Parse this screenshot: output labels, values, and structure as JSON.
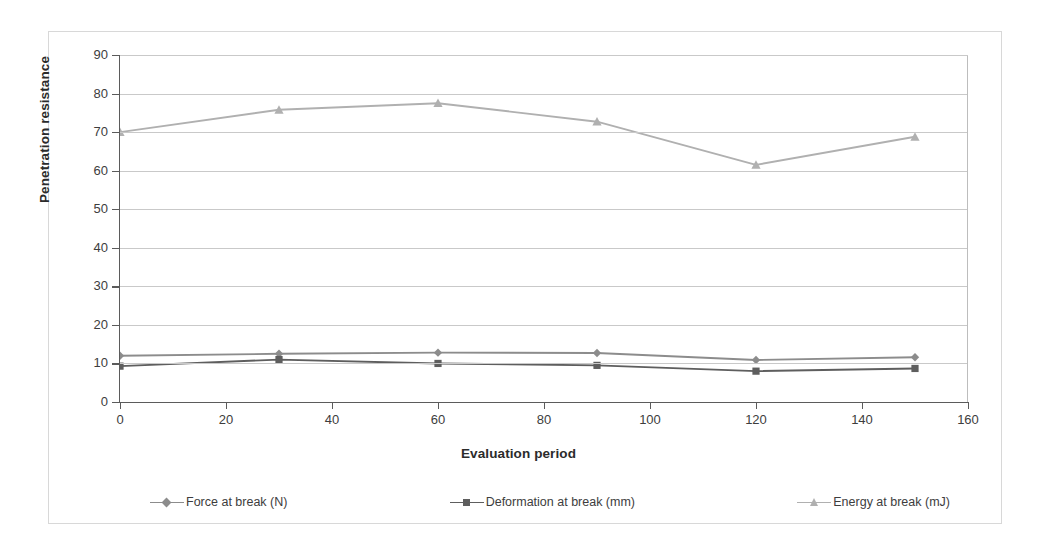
{
  "chart_data": {
    "type": "line",
    "title": "",
    "xlabel": "Evaluation period",
    "ylabel": "Penetration resistance",
    "xlim": [
      0,
      160
    ],
    "ylim": [
      0,
      90
    ],
    "xticks": [
      0,
      20,
      40,
      60,
      80,
      100,
      120,
      140,
      160
    ],
    "yticks": [
      0,
      10,
      20,
      30,
      40,
      50,
      60,
      70,
      80,
      90
    ],
    "grid": "horizontal",
    "legend_position": "bottom",
    "x": [
      0,
      30,
      60,
      90,
      120,
      150
    ],
    "series": [
      {
        "name": "Force at break (N)",
        "values": [
          12.0,
          12.5,
          12.8,
          12.7,
          10.9,
          11.6
        ],
        "color": "#8c8c8c",
        "marker": "diamond"
      },
      {
        "name": "Deformation at break (mm)",
        "values": [
          9.3,
          11.0,
          10.0,
          9.5,
          8.0,
          8.7
        ],
        "color": "#5e5e5e",
        "marker": "square"
      },
      {
        "name": "Energy at break (mJ)",
        "values": [
          70.0,
          75.8,
          77.5,
          72.7,
          61.5,
          68.8
        ],
        "color": "#b0b0b0",
        "marker": "triangle"
      }
    ]
  },
  "axes": {
    "y_title": "Penetration resistance",
    "x_title": "Evaluation period",
    "y_tick_labels": [
      "90",
      "80",
      "70",
      "60",
      "50",
      "40",
      "30",
      "20",
      "10",
      "0"
    ],
    "x_tick_labels": [
      "0",
      "20",
      "40",
      "60",
      "80",
      "100",
      "120",
      "140",
      "160"
    ]
  },
  "legend": {
    "entries": [
      {
        "label": "Force at break (N)",
        "color": "#8c8c8c",
        "marker": "diamond"
      },
      {
        "label": "Deformation at break (mm)",
        "color": "#5e5e5e",
        "marker": "square"
      },
      {
        "label": "Energy at break (mJ)",
        "color": "#b0b0b0",
        "marker": "triangle"
      }
    ]
  },
  "colors": {
    "grid": "#c9c9c9",
    "axis": "#5b5b5b",
    "frame": "#d8d8d8",
    "text": "#3d3d3d"
  }
}
